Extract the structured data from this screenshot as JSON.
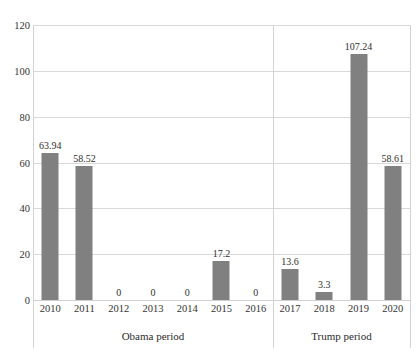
{
  "chart_data": {
    "type": "bar",
    "title": "",
    "xlabel": "",
    "ylabel": "",
    "categories": [
      "2010",
      "2011",
      "2012",
      "2013",
      "2014",
      "2015",
      "2016",
      "2017",
      "2018",
      "2019",
      "2020"
    ],
    "values": [
      63.94,
      58.52,
      0,
      0,
      0,
      17.2,
      0,
      13.6,
      3.3,
      107.24,
      58.61
    ],
    "value_labels": [
      "63.94",
      "58.52",
      "0",
      "0",
      "0",
      "17.2",
      "0",
      "13.6",
      "3.3",
      "107.24",
      "58.61"
    ],
    "ylim": [
      0,
      120
    ],
    "yticks": [
      0,
      20,
      40,
      60,
      80,
      100,
      120
    ],
    "ytick_labels": [
      "0",
      "20",
      "40",
      "60",
      "80",
      "100",
      "120"
    ],
    "grid": true,
    "legend": "none",
    "bar_color": "#808080",
    "grid_color": "#d9d9d9",
    "groups": [
      {
        "label": "Obama period",
        "start_index": 0,
        "end_index": 6
      },
      {
        "label": "Trump period",
        "start_index": 7,
        "end_index": 10
      }
    ]
  }
}
